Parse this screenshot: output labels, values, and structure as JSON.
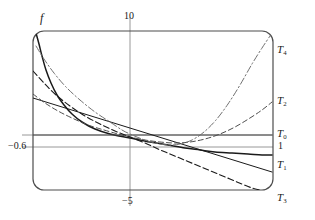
{
  "figure": {
    "kind": "function-and-taylor-polynomials-plot",
    "frame": {
      "x": 33,
      "y": 31,
      "width": 240,
      "height": 159,
      "corner_radius": 11,
      "stroke": "#4d4d4d"
    },
    "background": "#ffffff"
  },
  "labels": {
    "function": "f",
    "top_tick": "10",
    "bottom_tick": "−5",
    "left_tick": "−0.6",
    "one": "1",
    "t0": "T",
    "t0_sub": "0",
    "t1": "T",
    "t1_sub": "1",
    "t2": "T",
    "t2_sub": "2",
    "t3": "T",
    "t3_sub": "3",
    "t4": "T",
    "t4_sub": "4"
  },
  "gridlines": {
    "vertical": [
      {
        "label": "10",
        "x": 130
      }
    ],
    "horizontal": [
      {
        "label": "T0-level",
        "y": 135
      },
      {
        "label": "−0.6",
        "y": 147
      }
    ],
    "color": "#8c8c8c"
  },
  "chart_data": {
    "type": "line",
    "title": "",
    "xlabel": "",
    "ylabel": "",
    "xlim": [
      -20,
      20
    ],
    "ylim": [
      -1.4,
      1.4
    ],
    "grid": true,
    "legend": "curve-end-labels",
    "xticks": [
      {
        "value": 10,
        "label": "10"
      },
      {
        "value": -5,
        "label": "−5"
      }
    ],
    "yticks": [
      {
        "value": -0.6,
        "label": "−0.6"
      },
      {
        "value": 1,
        "label": "1"
      }
    ],
    "series": [
      {
        "name": "f",
        "style": "solid",
        "width": 1.5,
        "color": "#1a1a1a",
        "points": [
          [
            36,
            33
          ],
          [
            39,
            44
          ],
          [
            42,
            56
          ],
          [
            46,
            70
          ],
          [
            51,
            83
          ],
          [
            57,
            95
          ],
          [
            64,
            105
          ],
          [
            72,
            114
          ],
          [
            82,
            122
          ],
          [
            95,
            129
          ],
          [
            110,
            134
          ],
          [
            130,
            138
          ],
          [
            150,
            142
          ],
          [
            168,
            145
          ],
          [
            185,
            148
          ],
          [
            200,
            150
          ],
          [
            215,
            152
          ],
          [
            232,
            153
          ],
          [
            248,
            154
          ],
          [
            262,
            155
          ],
          [
            272,
            155
          ]
        ]
      },
      {
        "name": "T0",
        "style": "solid",
        "width": 1.0,
        "color": "#4d4d4d",
        "points": [
          [
            33,
            135
          ],
          [
            272,
            135
          ]
        ]
      },
      {
        "name": "T1",
        "style": "solid",
        "width": 1.0,
        "color": "#1a1a1a",
        "points": [
          [
            33,
            98
          ],
          [
            272,
            172
          ]
        ]
      },
      {
        "name": "T2",
        "style": "dashed",
        "width": 1.0,
        "color": "#4d4d4d",
        "dash": "5,3",
        "points": [
          [
            33,
            94
          ],
          [
            45,
            103
          ],
          [
            58,
            111
          ],
          [
            72,
            118
          ],
          [
            88,
            125
          ],
          [
            104,
            130
          ],
          [
            118,
            134
          ],
          [
            130,
            137
          ],
          [
            145,
            140
          ],
          [
            160,
            142
          ],
          [
            175,
            143
          ],
          [
            190,
            142
          ],
          [
            205,
            139
          ],
          [
            220,
            134
          ],
          [
            235,
            127
          ],
          [
            250,
            118
          ],
          [
            262,
            110
          ],
          [
            272,
            102
          ]
        ]
      },
      {
        "name": "T3",
        "style": "dashed",
        "width": 1.1,
        "color": "#1a1a1a",
        "dash": "6,3",
        "points": [
          [
            33,
            71
          ],
          [
            44,
            83
          ],
          [
            56,
            95
          ],
          [
            70,
            106
          ],
          [
            85,
            116
          ],
          [
            100,
            124
          ],
          [
            115,
            131
          ],
          [
            130,
            137
          ],
          [
            145,
            143
          ],
          [
            158,
            149
          ],
          [
            170,
            154
          ],
          [
            182,
            159
          ],
          [
            194,
            164
          ],
          [
            206,
            169
          ],
          [
            218,
            174
          ],
          [
            230,
            179
          ],
          [
            242,
            184
          ],
          [
            252,
            188
          ],
          [
            260,
            190
          ]
        ]
      },
      {
        "name": "T4",
        "style": "dashdot",
        "width": 1.0,
        "color": "#707070",
        "dash": "7,2.5,1.5,2.5",
        "points": [
          [
            36,
            46
          ],
          [
            44,
            59
          ],
          [
            54,
            73
          ],
          [
            66,
            87
          ],
          [
            80,
            100
          ],
          [
            95,
            112
          ],
          [
            110,
            122
          ],
          [
            122,
            130
          ],
          [
            130,
            134
          ],
          [
            142,
            139
          ],
          [
            155,
            143
          ],
          [
            168,
            145
          ],
          [
            180,
            144
          ],
          [
            192,
            140
          ],
          [
            204,
            132
          ],
          [
            216,
            120
          ],
          [
            228,
            104
          ],
          [
            240,
            85
          ],
          [
            252,
            64
          ],
          [
            262,
            48
          ],
          [
            270,
            36
          ],
          [
            272,
            33
          ]
        ]
      }
    ]
  }
}
